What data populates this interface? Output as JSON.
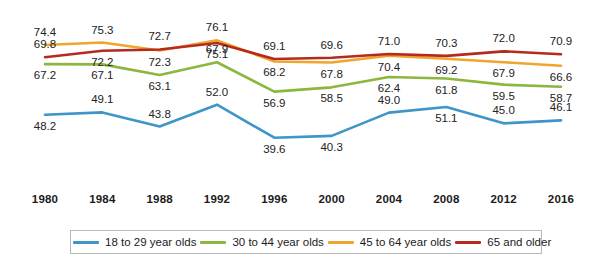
{
  "chart_data": {
    "type": "line",
    "title": "",
    "xlabel": "",
    "ylabel": "",
    "categories": [
      "1980",
      "1984",
      "1988",
      "1992",
      "1996",
      "2000",
      "2004",
      "2008",
      "2012",
      "2016"
    ],
    "ylim": [
      35,
      80
    ],
    "grid": false,
    "legend_position": "bottom",
    "series": [
      {
        "name": "18 to 29 year olds",
        "color": "#3d95c8",
        "values": [
          48.2,
          49.1,
          43.8,
          52.0,
          39.6,
          40.3,
          49.0,
          51.1,
          45.0,
          46.1
        ],
        "label_side": [
          "below",
          "above",
          "above",
          "above",
          "below",
          "below",
          "above",
          "below",
          "above",
          "above"
        ]
      },
      {
        "name": "30 to 44 year olds",
        "color": "#8cb73e",
        "values": [
          67.2,
          67.1,
          63.1,
          67.9,
          56.9,
          58.5,
          62.4,
          61.8,
          59.5,
          58.7
        ],
        "label_side": [
          "below",
          "below",
          "below",
          "above",
          "below",
          "below",
          "below",
          "below",
          "below",
          "below"
        ]
      },
      {
        "name": "45 to 64 year olds",
        "color": "#f0a52e",
        "values": [
          74.4,
          75.3,
          72.3,
          76.1,
          68.2,
          67.8,
          70.4,
          69.2,
          67.9,
          66.6
        ],
        "label_side": [
          "above",
          "above",
          "below",
          "above",
          "below",
          "below",
          "below",
          "below",
          "below",
          "below"
        ]
      },
      {
        "name": "65 and older",
        "color": "#b52a1c",
        "values": [
          69.8,
          72.2,
          72.7,
          75.1,
          69.1,
          69.6,
          71.0,
          70.3,
          72.0,
          70.9
        ],
        "label_side": [
          "above",
          "below",
          "above",
          "below",
          "above",
          "above",
          "above",
          "above",
          "above",
          "above"
        ]
      }
    ]
  },
  "legend": {
    "items": [
      {
        "label": "18 to 29 year olds",
        "color": "#3d95c8"
      },
      {
        "label": "30 to 44 year olds",
        "color": "#8cb73e"
      },
      {
        "label": "45 to 64 year olds",
        "color": "#f0a52e"
      },
      {
        "label": "65 and older",
        "color": "#b52a1c"
      }
    ]
  },
  "axis": {
    "ticks": [
      "1980",
      "1984",
      "1988",
      "1992",
      "1996",
      "2000",
      "2004",
      "2008",
      "2012",
      "2016"
    ]
  }
}
